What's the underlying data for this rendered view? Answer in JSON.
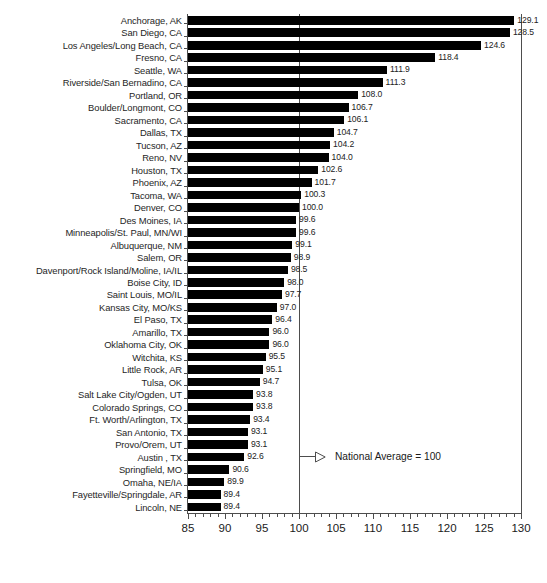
{
  "chart_data": {
    "type": "bar",
    "orientation": "horizontal",
    "title": "",
    "subtitle": "",
    "xlabel": "",
    "ylabel": "",
    "xlim": [
      85,
      130
    ],
    "xticks": [
      85,
      90,
      95,
      100,
      105,
      110,
      115,
      120,
      125,
      130
    ],
    "xtick_labels": [
      "85",
      "90",
      "95",
      "100",
      "105",
      "110",
      "115",
      "120",
      "125",
      "130"
    ],
    "minor_tick_step": 1,
    "grid": false,
    "legend": null,
    "bar_color": "#000000",
    "reference_line": {
      "value": 100,
      "label": "National Average = 100",
      "color": "#4d4d4d"
    },
    "annotations": [
      {
        "text": "National Average = 100",
        "x": 100,
        "near_category": "Austin , TX"
      }
    ],
    "categories": [
      "Anchorage, AK",
      "San Diego, CA",
      "Los Angeles/Long Beach, CA",
      "Fresno, CA",
      "Seattle, WA",
      "Riverside/San Bernadino, CA",
      "Portland, OR",
      "Boulder/Longmont, CO",
      "Sacramento, CA",
      "Dallas, TX",
      "Tucson, AZ",
      "Reno, NV",
      "Houston, TX",
      "Phoenix, AZ",
      "Tacoma, WA",
      "Denver, CO",
      "Des Moines, IA",
      "Minneapolis/St. Paul, MN/WI",
      "Albuquerque, NM",
      "Salem, OR",
      "Davenport/Rock Island/Moline, IA/IL",
      "Boise City, ID",
      "Saint Louis, MO/IL",
      "Kansas City, MO/KS",
      "El Paso, TX",
      "Amarillo, TX",
      "Oklahoma City, OK",
      "Witchita, KS",
      "Little Rock, AR",
      "Tulsa, OK",
      "Salt Lake City/Ogden, UT",
      "Colorado Springs, CO",
      "Ft. Worth/Arlington, TX",
      "San Antonio, TX",
      "Provo/Orem, UT",
      "Austin , TX",
      "Springfield, MO",
      "Omaha, NE/IA",
      "Fayetteville/Springdale, AR",
      "Lincoln, NE"
    ],
    "values": [
      129.1,
      128.5,
      124.6,
      118.4,
      111.9,
      111.3,
      108.0,
      106.7,
      106.1,
      104.7,
      104.2,
      104.0,
      102.6,
      101.7,
      100.3,
      100.0,
      99.6,
      99.6,
      99.1,
      98.9,
      98.5,
      98.0,
      97.7,
      97.0,
      96.4,
      96.0,
      96.0,
      95.5,
      95.1,
      94.7,
      93.8,
      93.8,
      93.4,
      93.1,
      93.1,
      92.6,
      90.6,
      89.9,
      89.4,
      89.4
    ],
    "value_labels": [
      "129.1",
      "128.5",
      "124.6",
      "118.4",
      "111.9",
      "111.3",
      "108.0",
      "106.7",
      "106.1",
      "104.7",
      "104.2",
      "104.0",
      "102.6",
      "101.7",
      "100.3",
      "100.0",
      "99.6",
      "99.6",
      "99.1",
      "98.9",
      "98.5",
      "98.0",
      "97.7",
      "97.0",
      "96.4",
      "96.0",
      "96.0",
      "95.5",
      "95.1",
      "94.7",
      "93.8",
      "93.8",
      "93.4",
      "93.1",
      "93.1",
      "92.6",
      "90.6",
      "89.9",
      "89.4",
      "89.4"
    ]
  }
}
